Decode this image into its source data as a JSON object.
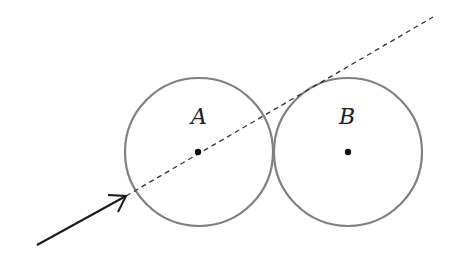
{
  "diagram": {
    "circles": [
      {
        "label": "A",
        "cx": 199,
        "cy": 152,
        "r": 74,
        "stroke": "#808080"
      },
      {
        "label": "B",
        "cx": 348,
        "cy": 152,
        "r": 74,
        "stroke": "#808080"
      }
    ],
    "incident_arrow": {
      "x1": 37,
      "y1": 245,
      "x2": 126,
      "y2": 196,
      "color": "#1a1a1a"
    },
    "dashed_line": {
      "x1": 126,
      "y1": 196,
      "x2": 433,
      "y2": 17,
      "color": "#333333"
    }
  }
}
